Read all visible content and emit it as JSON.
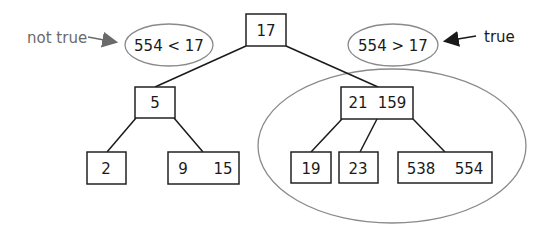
{
  "diagram": {
    "type": "b-tree",
    "nodes": {
      "root": {
        "keys": [
          "17"
        ]
      },
      "left": {
        "keys": [
          "5"
        ]
      },
      "right": {
        "keys": [
          "21",
          "159"
        ]
      },
      "left_left": {
        "keys": [
          "2"
        ]
      },
      "left_right": {
        "keys": [
          "9",
          "15"
        ]
      },
      "right_a": {
        "keys": [
          "19"
        ]
      },
      "right_b": {
        "keys": [
          "23"
        ]
      },
      "right_c": {
        "keys": [
          "538",
          "554"
        ]
      }
    },
    "comparisons": {
      "left": {
        "text": "554 < 17",
        "annotation": "not true"
      },
      "right": {
        "text": "554 > 17",
        "annotation": "true"
      }
    },
    "colors": {
      "line": "#1a1a1a",
      "oval": "#8a8a8a",
      "annotation_false": "#6a6a6a",
      "annotation_true": "#1a1a1a"
    }
  }
}
